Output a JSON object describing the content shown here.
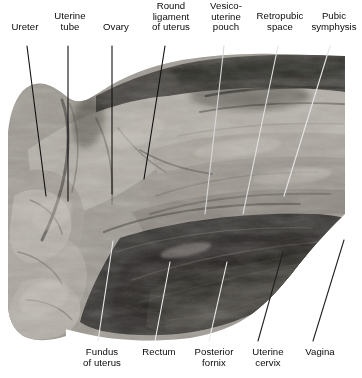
{
  "figure": {
    "kind": "anatomical-dissection-photograph",
    "rendering": "grayscale"
  },
  "labels_top": [
    {
      "id": "ureter",
      "text": "Ureter",
      "x": 3,
      "y": 22,
      "w": 44,
      "lines": 1
    },
    {
      "id": "uterine-tube",
      "text": "Uterine\ntube",
      "x": 45,
      "y": 11,
      "w": 50,
      "lines": 2
    },
    {
      "id": "ovary",
      "text": "Ovary",
      "x": 95,
      "y": 22,
      "w": 42,
      "lines": 1
    },
    {
      "id": "round-ligament",
      "text": "Round\nligament\nof uterus",
      "x": 140,
      "y": 1,
      "w": 62,
      "lines": 3
    },
    {
      "id": "vesico-uterine",
      "text": "Vesico-\nuterine\npouch",
      "x": 200,
      "y": 1,
      "w": 52,
      "lines": 3
    },
    {
      "id": "retropubic-space",
      "text": "Retropubic\nspace",
      "x": 249,
      "y": 11,
      "w": 62,
      "lines": 2
    },
    {
      "id": "pubic-symphysis",
      "text": "Pubic\nsymphysis",
      "x": 305,
      "y": 11,
      "w": 58,
      "lines": 2
    }
  ],
  "labels_bottom": [
    {
      "id": "fundus-of-uterus",
      "text": "Fundus\nof uterus",
      "x": 73,
      "y": 347,
      "w": 58,
      "lines": 2
    },
    {
      "id": "rectum",
      "text": "Rectum",
      "x": 135,
      "y": 347,
      "w": 48,
      "lines": 1
    },
    {
      "id": "posterior-fornix",
      "text": "Posterior\nfornix",
      "x": 186,
      "y": 347,
      "w": 56,
      "lines": 2
    },
    {
      "id": "uterine-cervix",
      "text": "Uterine\ncervix",
      "x": 243,
      "y": 347,
      "w": 50,
      "lines": 2
    },
    {
      "id": "vagina",
      "text": "Vagina",
      "x": 297,
      "y": 347,
      "w": 46,
      "lines": 1
    }
  ],
  "leaders_top": [
    {
      "id": "leader-ureter",
      "x1": 27,
      "y1": 46,
      "x2": 46,
      "y2": 196,
      "stroke": "#111111"
    },
    {
      "id": "leader-uterine-tube",
      "x1": 68,
      "y1": 46,
      "x2": 68,
      "y2": 201,
      "stroke": "#111111"
    },
    {
      "id": "leader-ovary",
      "x1": 112,
      "y1": 46,
      "x2": 112,
      "y2": 194,
      "stroke": "#111111"
    },
    {
      "id": "leader-round-ligament",
      "x1": 165,
      "y1": 46,
      "x2": 144,
      "y2": 179,
      "stroke": "#111111"
    },
    {
      "id": "leader-vesico-uterine",
      "x1": 224,
      "y1": 46,
      "x2": 205,
      "y2": 214,
      "stroke": "#d8d8d8"
    },
    {
      "id": "leader-retropubic-space",
      "x1": 278,
      "y1": 46,
      "x2": 243,
      "y2": 214,
      "stroke": "#e2e2e2"
    },
    {
      "id": "leader-pubic-symphysis",
      "x1": 330,
      "y1": 46,
      "x2": 284,
      "y2": 196,
      "stroke": "#e6e6e6"
    }
  ],
  "leaders_bottom": [
    {
      "id": "leader-fundus-of-uterus",
      "x1": 98,
      "y1": 341,
      "x2": 113,
      "y2": 241,
      "stroke": "#e8e8e8"
    },
    {
      "id": "leader-rectum",
      "x1": 155,
      "y1": 341,
      "x2": 170,
      "y2": 262,
      "stroke": "#ededed"
    },
    {
      "id": "leader-posterior-fornix",
      "x1": 209,
      "y1": 341,
      "x2": 227,
      "y2": 262,
      "stroke": "#ededed"
    },
    {
      "id": "leader-uterine-cervix",
      "x1": 258,
      "y1": 341,
      "x2": 283,
      "y2": 252,
      "stroke": "#222222"
    },
    {
      "id": "leader-vagina",
      "x1": 313,
      "y1": 341,
      "x2": 344,
      "y2": 240,
      "stroke": "#222222"
    }
  ],
  "palette": {
    "page_background": "#ffffff",
    "text": "#0a0a0a",
    "leader_dark": "#111111",
    "leader_light": "#e8e8e8",
    "tissue_light": "#b9b4ad",
    "tissue_mid": "#8b8680",
    "tissue_dark": "#4a4742",
    "tissue_darkest": "#1b1a18"
  }
}
